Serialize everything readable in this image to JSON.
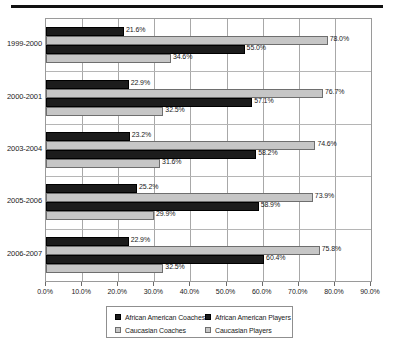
{
  "chart_data": {
    "type": "bar",
    "orientation": "horizontal",
    "title": "",
    "xlabel": "",
    "ylabel": "",
    "xlim": [
      0,
      90
    ],
    "xtick_step": 10,
    "xtick_labels": [
      "0.0%",
      "10.0%",
      "20.0%",
      "30.0%",
      "40.0%",
      "50.0%",
      "60.0%",
      "70.0%",
      "80.0%",
      "90.0%"
    ],
    "grid": true,
    "legend_position": "bottom",
    "categories": [
      "1999-2000",
      "2000-2001",
      "2003-2004",
      "2005-2006",
      "2006-2007"
    ],
    "series": [
      {
        "name": "African American Coaches",
        "color": "#1c1c1c",
        "values": [
          21.6,
          22.9,
          23.2,
          25.2,
          22.9
        ],
        "labels": [
          "21.6%",
          "22.9%",
          "23.2%",
          "25.2%",
          "22.9%"
        ]
      },
      {
        "name": "African American Players",
        "color": "#c6c6c6",
        "values": [
          78.0,
          76.7,
          74.6,
          73.9,
          75.8
        ],
        "labels": [
          "78.0%",
          "76.7%",
          "74.6%",
          "73.9%",
          "75.8%"
        ]
      },
      {
        "name": "Caucasian Coaches",
        "color": "#1c1c1c",
        "values": [
          55.0,
          57.1,
          58.2,
          58.9,
          60.4
        ],
        "labels": [
          "55.0%",
          "57.1%",
          "58.2%",
          "58.9%",
          "60.4%"
        ]
      },
      {
        "name": "Caucasian Players",
        "color": "#c6c6c6",
        "values": [
          34.6,
          32.5,
          31.6,
          29.9,
          32.5
        ],
        "labels": [
          "34.6%",
          "32.5%",
          "31.6%",
          "29.9%",
          "32.5%"
        ]
      }
    ]
  },
  "legend": {
    "items": [
      {
        "label": "African American Coaches",
        "swatch": "dark"
      },
      {
        "label": "Caucasian Coaches",
        "swatch": "light"
      },
      {
        "label": "African American Players",
        "swatch": "dark"
      },
      {
        "label": "Caucasian Players",
        "swatch": "light"
      }
    ]
  }
}
